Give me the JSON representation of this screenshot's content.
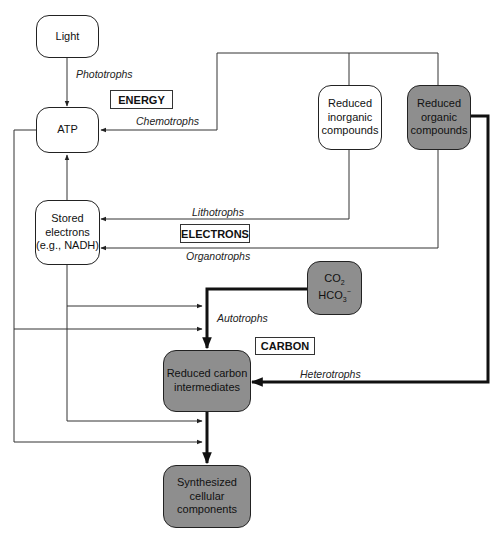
{
  "nodes": {
    "light": {
      "label": "Light"
    },
    "atp": {
      "label": "ATP"
    },
    "stored_electrons": {
      "lines": [
        "Stored",
        "electrons",
        "(e.g., NADH)"
      ]
    },
    "reduced_inorganic": {
      "lines": [
        "Reduced",
        "inorganic",
        "compounds"
      ]
    },
    "reduced_organic": {
      "lines": [
        "Reduced",
        "organic",
        "compounds"
      ]
    },
    "co2": {
      "line1": "CO",
      "line1_sub": "2",
      "line2": "HCO",
      "line2_sub": "3",
      "line2_sup": "−"
    },
    "reduced_carbon": {
      "lines": [
        "Reduced carbon",
        "intermediates"
      ]
    },
    "synthesized": {
      "lines": [
        "Synthesized",
        "cellular",
        "components"
      ]
    }
  },
  "categories": {
    "energy": "ENERGY",
    "electrons": "ELECTRONS",
    "carbon": "CARBON"
  },
  "edge_labels": {
    "phototrophs": "Phototrophs",
    "chemotrophs": "Chemotrophs",
    "lithotrophs": "Lithotrophs",
    "organotrophs": "Organotrophs",
    "autotrophs": "Autotrophs",
    "heterotrophs": "Heterotrophs"
  },
  "colors": {
    "gray_node": "#8e8e8e",
    "line": "#333333"
  }
}
